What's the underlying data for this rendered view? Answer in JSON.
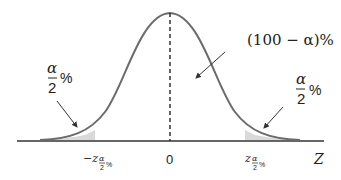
{
  "diagram": {
    "type": "normal-distribution",
    "curve_color": "#6b6b6b",
    "shade_color": "#d9d9d9",
    "axis_color": "#333333",
    "labels": {
      "center_area": "(100 − α)%",
      "left_tail_num": "α",
      "left_tail_den": "2",
      "left_tail_pct": "%",
      "right_tail_num": "α",
      "right_tail_den": "2",
      "right_tail_pct": "%",
      "axis_name": "Z",
      "tick_center": "0",
      "tick_left_prefix": "−z",
      "tick_right_prefix": "z",
      "tick_sub_num": "α",
      "tick_sub_den": "2",
      "tick_sub_pct": "%"
    }
  }
}
